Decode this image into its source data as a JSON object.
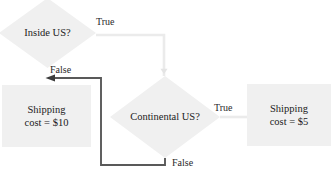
{
  "diagram": {
    "type": "flowchart",
    "title": "",
    "nodes": [
      {
        "id": "inside_us",
        "shape": "diamond",
        "label": "Inside US?",
        "fill": "#f0f0f0"
      },
      {
        "id": "continental_us",
        "shape": "diamond",
        "label": "Continental US?",
        "fill": "#f0f0f0"
      },
      {
        "id": "cost_10",
        "shape": "rectangle",
        "label_line1": "Shipping",
        "label_line2": "cost = $10",
        "fill": "#f0f0f0"
      },
      {
        "id": "cost_5",
        "shape": "rectangle",
        "label_line1": "Shipping",
        "label_line2": "cost = $5",
        "fill": "#f0f0f0"
      }
    ],
    "edges": [
      {
        "id": "inside_true",
        "from": "inside_us",
        "to": "continental_us",
        "label": "True",
        "color": "#e8e8e8",
        "style": "orthogonal"
      },
      {
        "id": "continental_true",
        "from": "continental_us",
        "to": "cost_5",
        "label": "True",
        "color": "#e8e8e8",
        "style": "straight"
      },
      {
        "id": "continental_false",
        "from": "continental_us",
        "to": "cost_10",
        "label": "False",
        "color": "#5a5a5a",
        "style": "orthogonal-arrow"
      }
    ],
    "edge_labels": {
      "true_top": "True",
      "false_left": "False",
      "true_right": "True",
      "false_bottom": "False"
    }
  }
}
